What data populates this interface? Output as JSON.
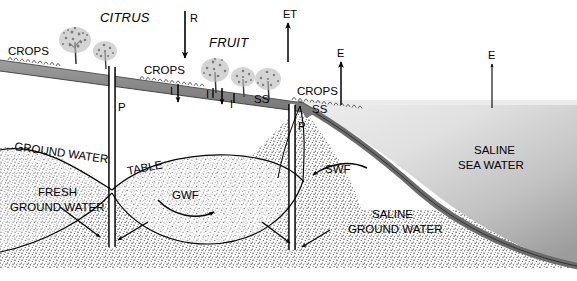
{
  "figure": {
    "type": "hydrogeological-cross-section",
    "title_text": "",
    "background_color": "#ffffff",
    "width": 577,
    "height": 281
  },
  "colors": {
    "land_surface": "#8c8c8c",
    "sea_water_light": "#e9e9e9",
    "sea_water_dark": "#9a9a9a",
    "seabed": "#6e6e6e",
    "stipple": "#4a4a4a",
    "line": "#000000",
    "faint_text": "#c8c8c8"
  },
  "labels": {
    "crops_left": "CROPS",
    "citrus": "CITRUS",
    "crops_mid": "CROPS",
    "fruit": "FRUIT",
    "crops_right": "CROPS",
    "recharge": "R",
    "evapotranspiration": "ET",
    "evaporation_left": "E",
    "evaporation_right": "E",
    "infiltration_1": "I",
    "infiltration_2": "I",
    "infiltration_3": "I",
    "seepage_mid": "SS",
    "seepage_right": "SS",
    "pumping_well_1": "P",
    "pumping_well_2": "P",
    "ground_water": "GROUND WATER",
    "table": "TABLE",
    "fresh_ground_water_line1": "FRESH",
    "fresh_ground_water_line2": "GROUND WATER",
    "ground_water_flow": "GWF",
    "salt_water_flow": "SWF",
    "saline_sea_water_line1": "SALINE",
    "saline_sea_water_line2": "SEA WATER",
    "saline_ground_water_line1": "SALINE",
    "saline_ground_water_line2": "GROUND WATER"
  },
  "legend_semantics": {
    "R": "Recharge (rainfall)",
    "ET": "Evapotranspiration",
    "E": "Evaporation",
    "I": "Infiltration",
    "SS": "Soil salinity / seepage",
    "P": "Pumping well",
    "GWF": "Ground water flow",
    "SWF": "Salt water flow"
  },
  "elements": {
    "wells": [
      {
        "id": "well-1",
        "label": "P",
        "x": 112
      },
      {
        "id": "well-2",
        "label": "P",
        "x": 292
      }
    ],
    "trees": [
      {
        "id": "tree-citrus-1",
        "x": 75,
        "y": 60,
        "scale": 1.0
      },
      {
        "id": "tree-citrus-2",
        "x": 105,
        "y": 66,
        "scale": 0.78
      },
      {
        "id": "tree-fruit-1",
        "x": 215,
        "y": 88,
        "scale": 0.95
      },
      {
        "id": "tree-fruit-2",
        "x": 243,
        "y": 92,
        "scale": 0.85
      },
      {
        "id": "tree-fruit-3",
        "x": 268,
        "y": 95,
        "scale": 0.9
      }
    ],
    "arrows": {
      "recharge_down": {
        "from_y": 10,
        "to_y": 60,
        "x": 185
      },
      "evapotranspiration_up": {
        "from_y": 62,
        "to_y": 22,
        "x": 288
      },
      "evaporation_left_up": {
        "from_y": 105,
        "to_y": 62,
        "x": 341
      },
      "evaporation_right_up": {
        "from_y": 108,
        "to_y": 63,
        "x": 492
      }
    }
  }
}
